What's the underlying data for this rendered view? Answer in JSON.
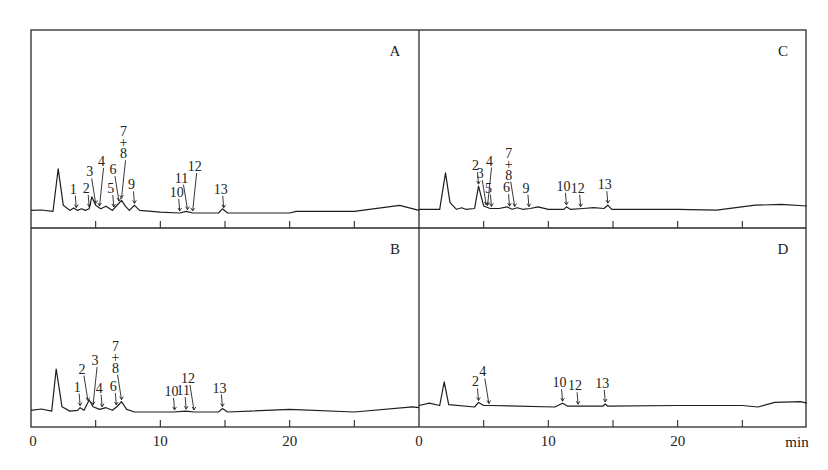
{
  "chart_data": {
    "type": "line",
    "title": "",
    "xlabel": "min",
    "ylabel": "",
    "xlim": [
      0,
      30
    ],
    "x_ticks_major": [
      0,
      10,
      20
    ],
    "x_ticks_minor": [
      5,
      15,
      25
    ],
    "grid": false,
    "layout": "2x2",
    "panels": [
      {
        "id": "A",
        "label": "A",
        "position": "top-left",
        "baseline_trace": [
          [
            0,
            0.3
          ],
          [
            0.8,
            0.35
          ],
          [
            1.7,
            0.2
          ],
          [
            2.1,
            5.2
          ],
          [
            2.5,
            0.9
          ],
          [
            3.0,
            0.3
          ],
          [
            3.3,
            0.6
          ],
          [
            3.6,
            0.3
          ],
          [
            3.9,
            0.5
          ],
          [
            4.2,
            0.3
          ],
          [
            4.5,
            0.5
          ],
          [
            4.7,
            1.9
          ],
          [
            5.0,
            0.9
          ],
          [
            5.4,
            0.5
          ],
          [
            5.8,
            0.8
          ],
          [
            6.3,
            0.3
          ],
          [
            6.7,
            1.0
          ],
          [
            7.0,
            1.5
          ],
          [
            7.3,
            0.8
          ],
          [
            7.6,
            0.3
          ],
          [
            8.0,
            0.9
          ],
          [
            8.4,
            0.3
          ],
          [
            10.0,
            0.1
          ],
          [
            11.5,
            0.0
          ],
          [
            12.0,
            0.2
          ],
          [
            12.5,
            0.0
          ],
          [
            14.5,
            0.0
          ],
          [
            14.8,
            0.5
          ],
          [
            15.2,
            0.0
          ],
          [
            20,
            0.0
          ],
          [
            20.5,
            0.2
          ],
          [
            25,
            0.2
          ],
          [
            28.5,
            0.9
          ],
          [
            30,
            0.3
          ]
        ],
        "peaks": [
          {
            "label": "1",
            "rt": 3.5
          },
          {
            "label": "2",
            "rt": 4.5
          },
          {
            "label": "3",
            "rt": 5.0
          },
          {
            "label": "4",
            "rt": 5.3
          },
          {
            "label": "5",
            "rt": 6.4
          },
          {
            "label": "6",
            "rt": 6.8
          },
          {
            "label": "7+8",
            "rt": 7.0
          },
          {
            "label": "9",
            "rt": 8.0
          },
          {
            "label": "10",
            "rt": 11.5
          },
          {
            "label": "11",
            "rt": 12.1
          },
          {
            "label": "12",
            "rt": 12.5
          },
          {
            "label": "13",
            "rt": 14.9
          }
        ]
      },
      {
        "id": "B",
        "label": "B",
        "position": "bottom-left",
        "baseline_trace": [
          [
            0,
            0.2
          ],
          [
            0.8,
            0.35
          ],
          [
            1.6,
            0.1
          ],
          [
            1.95,
            5.0
          ],
          [
            2.4,
            0.6
          ],
          [
            3.0,
            0.1
          ],
          [
            3.6,
            0.2
          ],
          [
            3.8,
            0.5
          ],
          [
            4.1,
            0.2
          ],
          [
            4.5,
            1.4
          ],
          [
            4.8,
            0.6
          ],
          [
            5.3,
            0.3
          ],
          [
            5.8,
            0.5
          ],
          [
            6.3,
            0.2
          ],
          [
            6.7,
            0.7
          ],
          [
            7.0,
            1.2
          ],
          [
            7.4,
            0.3
          ],
          [
            8.0,
            0.0
          ],
          [
            11.0,
            0.0
          ],
          [
            12.0,
            0.1
          ],
          [
            12.6,
            0.0
          ],
          [
            14.5,
            0.0
          ],
          [
            14.8,
            0.4
          ],
          [
            15.2,
            0.0
          ],
          [
            20,
            0.3
          ],
          [
            25,
            0.0
          ],
          [
            29.5,
            0.6
          ],
          [
            30,
            0.5
          ]
        ],
        "peaks": [
          {
            "label": "1",
            "rt": 3.8
          },
          {
            "label": "2",
            "rt": 4.4
          },
          {
            "label": "3",
            "rt": 4.8
          },
          {
            "label": "4",
            "rt": 5.5
          },
          {
            "label": "6",
            "rt": 6.6
          },
          {
            "label": "7+8",
            "rt": 7.0
          },
          {
            "label": "10",
            "rt": 11.1
          },
          {
            "label": "11",
            "rt": 12.0
          },
          {
            "label": "12",
            "rt": 12.6
          },
          {
            "label": "13",
            "rt": 14.8
          }
        ]
      },
      {
        "id": "C",
        "label": "C",
        "position": "top-right",
        "baseline_trace": [
          [
            0,
            0.2
          ],
          [
            1.6,
            0.2
          ],
          [
            2.05,
            4.6
          ],
          [
            2.4,
            1.0
          ],
          [
            2.9,
            0.2
          ],
          [
            3.3,
            0.4
          ],
          [
            3.6,
            0.2
          ],
          [
            4.3,
            0.3
          ],
          [
            4.6,
            3.0
          ],
          [
            5.0,
            0.6
          ],
          [
            5.5,
            0.3
          ],
          [
            6.2,
            0.3
          ],
          [
            6.8,
            0.5
          ],
          [
            7.2,
            0.2
          ],
          [
            7.6,
            0.4
          ],
          [
            8.0,
            0.2
          ],
          [
            8.6,
            0.3
          ],
          [
            9.2,
            0.5
          ],
          [
            10,
            0.2
          ],
          [
            11.2,
            0.2
          ],
          [
            11.4,
            0.5
          ],
          [
            11.7,
            0.2
          ],
          [
            12.7,
            0.3
          ],
          [
            13.5,
            0.4
          ],
          [
            14.3,
            0.3
          ],
          [
            14.6,
            0.7
          ],
          [
            14.9,
            0.2
          ],
          [
            20,
            0.2
          ],
          [
            23,
            0.1
          ],
          [
            26,
            0.7
          ],
          [
            28,
            0.8
          ],
          [
            30,
            0.6
          ]
        ],
        "peaks": [
          {
            "label": "2",
            "rt": 4.6
          },
          {
            "label": "3",
            "rt": 5.2
          },
          {
            "label": "4",
            "rt": 5.3
          },
          {
            "label": "5",
            "rt": 5.6
          },
          {
            "label": "6",
            "rt": 7.0
          },
          {
            "label": "7+8",
            "rt": 7.4
          },
          {
            "label": "9",
            "rt": 8.5
          },
          {
            "label": "10",
            "rt": 11.4
          },
          {
            "label": "12",
            "rt": 12.5
          },
          {
            "label": "13",
            "rt": 14.6
          }
        ]
      },
      {
        "id": "D",
        "label": "D",
        "position": "bottom-right",
        "baseline_trace": [
          [
            0,
            0.2
          ],
          [
            0.8,
            0.5
          ],
          [
            1.6,
            0.2
          ],
          [
            1.95,
            3.3
          ],
          [
            2.3,
            0.3
          ],
          [
            4.3,
            0.0
          ],
          [
            4.6,
            0.6
          ],
          [
            5.0,
            0.2
          ],
          [
            5.5,
            0.2
          ],
          [
            10.5,
            0.0
          ],
          [
            11.1,
            0.5
          ],
          [
            11.5,
            0.1
          ],
          [
            12.3,
            0.1
          ],
          [
            14.2,
            0.1
          ],
          [
            14.4,
            0.4
          ],
          [
            14.6,
            0.1
          ],
          [
            20,
            0.2
          ],
          [
            25,
            0.2
          ],
          [
            26.2,
            0.0
          ],
          [
            27.5,
            0.6
          ],
          [
            29.5,
            0.7
          ],
          [
            30,
            0.5
          ]
        ],
        "peaks": [
          {
            "label": "2",
            "rt": 4.6
          },
          {
            "label": "4",
            "rt": 5.4
          },
          {
            "label": "10",
            "rt": 11.1
          },
          {
            "label": "12",
            "rt": 12.3
          },
          {
            "label": "13",
            "rt": 14.4
          }
        ]
      }
    ]
  },
  "axis": {
    "tick_labels_left": [
      "0",
      "10",
      "20"
    ],
    "tick_labels_right": [
      "0",
      "10",
      "20"
    ],
    "unit": "min"
  }
}
